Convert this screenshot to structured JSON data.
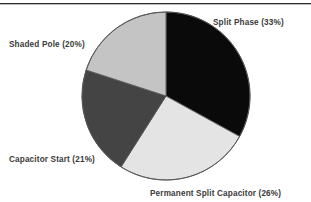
{
  "page": {
    "width": 311,
    "height": 202,
    "background": "#ffffff",
    "top_rule_color": "#2e2e2e"
  },
  "chart_data": {
    "type": "pie",
    "title": "",
    "subtitle": "",
    "xlabel": "",
    "ylabel": "",
    "legend_position": "none",
    "labels_position": "outside",
    "grid": false,
    "start_angle_deg": 0,
    "direction": "clockwise",
    "center": {
      "x": 166,
      "y": 96
    },
    "radius": 84,
    "outline_color": "#555555",
    "categories": [
      "Split Phase",
      "Permanent Split Capacitor",
      "Capacitor Start",
      "Shaded Pole"
    ],
    "values": [
      33,
      26,
      21,
      20
    ],
    "units": "%",
    "slices": [
      {
        "name": "Split Phase",
        "value": 33,
        "label": "Split Phase (33%)",
        "color": "#0a0a0a",
        "start_deg": 0,
        "end_deg": 118.8
      },
      {
        "name": "Permanent Split Capacitor",
        "value": 26,
        "label": "Permanent Split Capacitor (26%)",
        "color": "#e4e4e4",
        "start_deg": 118.8,
        "end_deg": 212.4
      },
      {
        "name": "Capacitor Start",
        "value": 21,
        "label": "Capacitor Start (21%)",
        "color": "#444444",
        "start_deg": 212.4,
        "end_deg": 288.0
      },
      {
        "name": "Shaded Pole",
        "value": 20,
        "label": "Shaded Pole (20%)",
        "color": "#c4c4c4",
        "start_deg": 288.0,
        "end_deg": 360.0
      }
    ],
    "annotations": []
  }
}
